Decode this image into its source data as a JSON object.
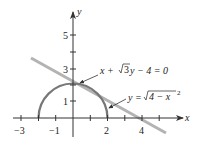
{
  "diagram": {
    "title": "",
    "axes": {
      "x_label": "x",
      "y_label": "y",
      "x_ticks": [
        {
          "value": -3,
          "label": "−3"
        },
        {
          "value": -2,
          "label": ""
        },
        {
          "value": -1,
          "label": "−1"
        },
        {
          "value": 0,
          "label": ""
        },
        {
          "value": 1,
          "label": ""
        },
        {
          "value": 2,
          "label": "2"
        },
        {
          "value": 3,
          "label": ""
        },
        {
          "value": 4,
          "label": "4"
        },
        {
          "value": 5,
          "label": ""
        }
      ],
      "y_ticks": [
        {
          "value": 1,
          "label": "1"
        },
        {
          "value": 2,
          "label": ""
        },
        {
          "value": 3,
          "label": "3"
        },
        {
          "value": 4,
          "label": ""
        },
        {
          "value": 5,
          "label": "5"
        }
      ]
    },
    "curves": [
      {
        "name": "semicircle",
        "equation": "y = √(4 − x²)",
        "label_main": "y = ",
        "label_radicand": "4 − x",
        "label_exp": "2",
        "color": "#777777"
      },
      {
        "name": "tangent-line",
        "equation": "x + √3y − 4 = 0",
        "label_pre": "x + ",
        "label_radicand": "3",
        "label_post": "y − 4 = 0",
        "color": "#b0b0b0"
      }
    ],
    "colors": {
      "axes": "#333333",
      "semicircle": "#777777",
      "line": "#b3b3b3",
      "arrow": "#333333"
    }
  }
}
